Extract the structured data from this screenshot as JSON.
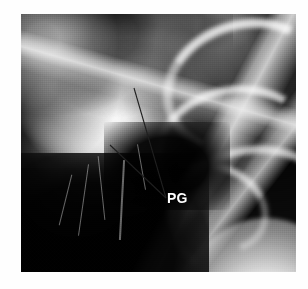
{
  "figure": {
    "kind": "chest-radiograph",
    "modality": "X-ray",
    "background_color": "#ffffff",
    "film_color": "#0a0a0a",
    "frame": {
      "x": 21,
      "y": 14,
      "width": 275,
      "height": 258
    }
  },
  "annotations": {
    "labels": [
      {
        "id": "pg",
        "text": "PG",
        "color": "#ffffff",
        "font_weight": "bold",
        "font_size_px": 14,
        "x": 167,
        "y": 191
      }
    ],
    "leader_lines": [
      {
        "id": "leader-upper",
        "color": "#1d1d1d",
        "x1": 134,
        "y1": 88,
        "x2": 166,
        "y2": 198
      },
      {
        "id": "leader-lower",
        "color": "#1d1d1d",
        "x1": 110,
        "y1": 145,
        "x2": 166,
        "y2": 198
      }
    ]
  },
  "regions": {
    "mass_opacity": "bright radiodense mass, left of centre",
    "bone_structures": "ribs and vertebral bodies, right side",
    "dark_lung_field": "inferior lung field, lower left",
    "diaphragm": "bright curved diaphragm, lower right"
  }
}
